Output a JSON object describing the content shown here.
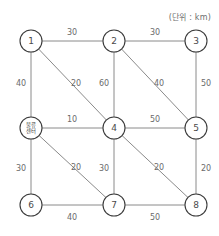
{
  "diagram": {
    "unit_note": "(단위 : km)",
    "colors": {
      "edge": "#8a8a8a",
      "node_stroke": "#3b3b3b",
      "node_fill": "#ffffff",
      "label_text": "#4a4a4a",
      "weight_text": "#6b6b6b",
      "note_text": "#6e6e6e",
      "background": "#ffffff"
    },
    "nodes": [
      {
        "id": "n1",
        "label": "1",
        "label_lines": [
          "1"
        ],
        "x": 31,
        "y": 41,
        "r": 11,
        "is_hub": false
      },
      {
        "id": "n2",
        "label": "2",
        "label_lines": [
          "2"
        ],
        "x": 114,
        "y": 41,
        "r": 11,
        "is_hub": false
      },
      {
        "id": "n3",
        "label": "3",
        "label_lines": [
          "3"
        ],
        "x": 196,
        "y": 41,
        "r": 11,
        "is_hub": false
      },
      {
        "id": "hub",
        "label": "물류센터",
        "label_lines": [
          "물류",
          "센터"
        ],
        "x": 31,
        "y": 128,
        "r": 11,
        "is_hub": true
      },
      {
        "id": "n4",
        "label": "4",
        "label_lines": [
          "4"
        ],
        "x": 114,
        "y": 128,
        "r": 11,
        "is_hub": false
      },
      {
        "id": "n5",
        "label": "5",
        "label_lines": [
          "5"
        ],
        "x": 196,
        "y": 128,
        "r": 11,
        "is_hub": false
      },
      {
        "id": "n6",
        "label": "6",
        "label_lines": [
          "6"
        ],
        "x": 31,
        "y": 205,
        "r": 11,
        "is_hub": false
      },
      {
        "id": "n7",
        "label": "7",
        "label_lines": [
          "7"
        ],
        "x": 114,
        "y": 205,
        "r": 11,
        "is_hub": false
      },
      {
        "id": "n8",
        "label": "8",
        "label_lines": [
          "8"
        ],
        "x": 196,
        "y": 205,
        "r": 11,
        "is_hub": false
      }
    ],
    "edges": [
      {
        "id": "e-1-2",
        "from": "n1",
        "to": "n2",
        "weight": "30",
        "kind": "horizontal",
        "label_x": 72,
        "label_y": 32
      },
      {
        "id": "e-2-3",
        "from": "n2",
        "to": "n3",
        "weight": "30",
        "kind": "horizontal",
        "label_x": 155,
        "label_y": 32
      },
      {
        "id": "e-hub-4",
        "from": "hub",
        "to": "n4",
        "weight": "10",
        "kind": "horizontal",
        "label_x": 72,
        "label_y": 119
      },
      {
        "id": "e-4-5",
        "from": "n4",
        "to": "n5",
        "weight": "50",
        "kind": "horizontal",
        "label_x": 155,
        "label_y": 119
      },
      {
        "id": "e-6-7",
        "from": "n6",
        "to": "n7",
        "weight": "40",
        "kind": "horizontal",
        "label_x": 72,
        "label_y": 217
      },
      {
        "id": "e-7-8",
        "from": "n7",
        "to": "n8",
        "weight": "50",
        "kind": "horizontal",
        "label_x": 155,
        "label_y": 217
      },
      {
        "id": "e-1-hub",
        "from": "n1",
        "to": "hub",
        "weight": "40",
        "kind": "vertical",
        "label_x": 21,
        "label_y": 83
      },
      {
        "id": "e-2-4",
        "from": "n2",
        "to": "n4",
        "weight": "60",
        "kind": "vertical",
        "label_x": 104,
        "label_y": 83
      },
      {
        "id": "e-3-5",
        "from": "n3",
        "to": "n5",
        "weight": "50",
        "kind": "vertical",
        "label_x": 206,
        "label_y": 83
      },
      {
        "id": "e-hub-6",
        "from": "hub",
        "to": "n6",
        "weight": "30",
        "kind": "vertical",
        "label_x": 21,
        "label_y": 168
      },
      {
        "id": "e-4-7",
        "from": "n4",
        "to": "n7",
        "weight": "30",
        "kind": "vertical",
        "label_x": 104,
        "label_y": 168
      },
      {
        "id": "e-5-8",
        "from": "n5",
        "to": "n8",
        "weight": "20",
        "kind": "vertical",
        "label_x": 206,
        "label_y": 168
      },
      {
        "id": "e-1-4",
        "from": "n1",
        "to": "n4",
        "weight": "20",
        "kind": "diagonal",
        "label_x": 76,
        "label_y": 83
      },
      {
        "id": "e-2-5",
        "from": "n2",
        "to": "n5",
        "weight": "40",
        "kind": "diagonal",
        "label_x": 159,
        "label_y": 83
      },
      {
        "id": "e-hub-7",
        "from": "hub",
        "to": "n7",
        "weight": "20",
        "kind": "diagonal",
        "label_x": 76,
        "label_y": 167
      },
      {
        "id": "e-4-8",
        "from": "n4",
        "to": "n8",
        "weight": "20",
        "kind": "diagonal",
        "label_x": 159,
        "label_y": 167
      }
    ]
  }
}
